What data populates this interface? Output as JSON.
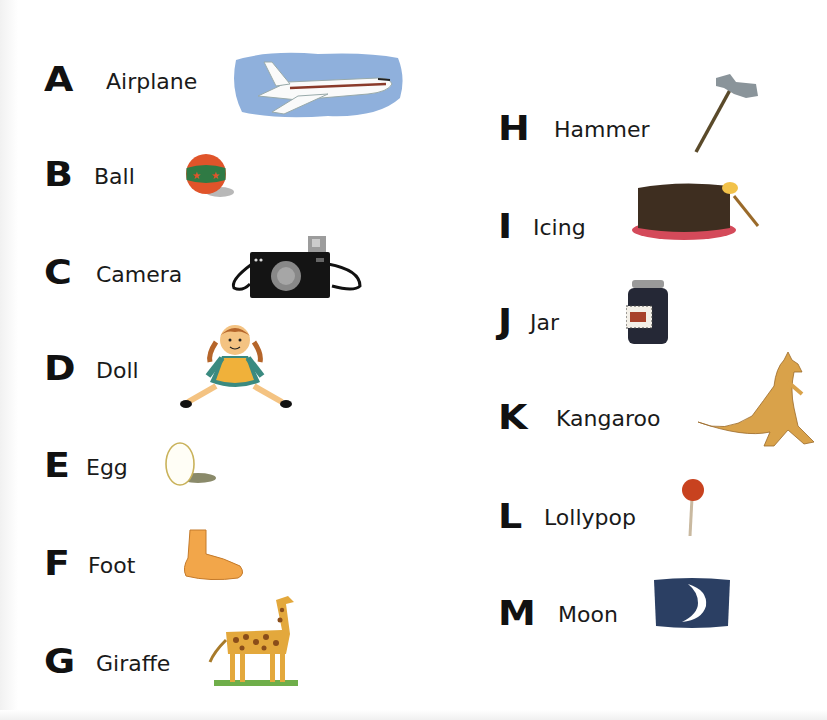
{
  "page": {
    "background": "#ffffff"
  },
  "left_column": [
    {
      "letter": "A",
      "word": "Airplane",
      "icon": "airplane-icon"
    },
    {
      "letter": "B",
      "word": "Ball",
      "icon": "ball-icon"
    },
    {
      "letter": "C",
      "word": "Camera",
      "icon": "camera-icon"
    },
    {
      "letter": "D",
      "word": "Doll",
      "icon": "doll-icon"
    },
    {
      "letter": "E",
      "word": "Egg",
      "icon": "egg-icon"
    },
    {
      "letter": "F",
      "word": "Foot",
      "icon": "foot-icon"
    },
    {
      "letter": "G",
      "word": "Giraffe",
      "icon": "giraffe-icon"
    }
  ],
  "right_column": [
    {
      "letter": "H",
      "word": "Hammer",
      "icon": "hammer-icon"
    },
    {
      "letter": "I",
      "word": "Icing",
      "icon": "icing-cake-icon"
    },
    {
      "letter": "J",
      "word": "Jar",
      "icon": "jar-icon"
    },
    {
      "letter": "K",
      "word": "Kangaroo",
      "icon": "kangaroo-icon"
    },
    {
      "letter": "L",
      "word": "Lollypop",
      "icon": "lollypop-icon"
    },
    {
      "letter": "M",
      "word": "Moon",
      "icon": "moon-icon"
    }
  ],
  "colors": {
    "sky_blue": "#8fb0dc",
    "night_navy": "#2b3f63",
    "giraffe_yellow": "#e3a83c",
    "kangaroo_tan": "#d9a24a",
    "foot_orange": "#f2a64a",
    "ball_green": "#2f7a44",
    "ball_orange": "#e0542a",
    "lolly_red": "#c8421f",
    "cake_brown": "#3e2e20",
    "plate_pink": "#d44a5a"
  }
}
